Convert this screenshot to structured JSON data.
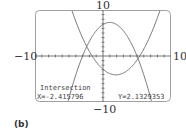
{
  "chart_data": {
    "type": "line",
    "title": "",
    "xlabel": "",
    "ylabel": "",
    "xlim": [
      -10,
      10
    ],
    "ylim": [
      -10,
      10
    ],
    "grid": false,
    "tick_labels": {
      "x_min": "−10",
      "x_max": "10",
      "y_min": "−10",
      "y_max": "10"
    },
    "series": [
      {
        "name": "downward parabola",
        "form": "y = -0.456(x-1)^2 + 7.3",
        "vertex": [
          1.0,
          7.3
        ],
        "roots": [
          -3.0,
          5.0
        ]
      },
      {
        "name": "upward parabola",
        "form": "y = 0.334(x-1.9)^2 - 4.1",
        "vertex": [
          1.9,
          -4.1
        ],
        "roots": [
          -1.6,
          5.4
        ]
      }
    ],
    "annotation": {
      "label": "Intersection",
      "x_text": "X=-2.415796",
      "y_text": "Y=2.1329353",
      "x": -2.415796,
      "y": 2.1329353
    }
  },
  "labels": {
    "y_top": "10",
    "y_bottom": "−10",
    "x_left": "−10",
    "x_right": "10",
    "panel": "(b)",
    "intersection": "Intersection",
    "x_value": "X=-2.415796",
    "y_value": "Y=2.1329353"
  },
  "colors": {
    "curve": "#6a6a6a",
    "frame": "#9a9a9a",
    "axis": "#555555"
  }
}
